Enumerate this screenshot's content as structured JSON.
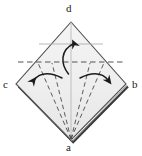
{
  "figure": {
    "type": "origami-fold-diagram",
    "background_color": "#ffffff",
    "paper_fill_top": "#f2f2f2",
    "paper_fill_bottom": "#ededed",
    "paper_outline_color": "#4d4d4d",
    "thick_edge_color": "#333333",
    "fold_line_color": "#555555",
    "arrow_color": "#1a1a1a",
    "label_color": "#1a1a1a"
  },
  "labels": {
    "top": "d",
    "bottom": "a",
    "left": "c",
    "right": "b"
  },
  "geometry": {
    "vertex_top": [
      71,
      22
    ],
    "vertex_bottom": [
      71,
      140
    ],
    "vertex_left": [
      16,
      84
    ],
    "vertex_right": [
      126,
      84
    ],
    "horizontal_crease_y": 44,
    "horizontal_fold_y": 62
  },
  "elements": {
    "center_arrow": "curved-arrow-up",
    "left_arrow": "curved-arrow-left",
    "right_arrow": "curved-arrow-right",
    "center_crease": "vertical-crease-line",
    "upper_crease": "horizontal-crease-line",
    "valley_fold": "horizontal-dashed-fold-line",
    "lower_folds": "diagonal-dashed-fold-lines"
  }
}
